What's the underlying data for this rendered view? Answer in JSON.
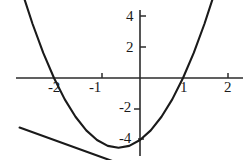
{
  "figure": {
    "title": "",
    "background_color": "#ffffff",
    "ink_color": "#1a1a1a",
    "width": 247,
    "height": 160
  },
  "axes": {
    "origin_px": {
      "x": 140,
      "y": 78
    },
    "px_per_unit_x": 43,
    "px_per_unit_y": 31,
    "x_axis_label": "",
    "y_axis_label": ""
  },
  "labels": {
    "y_top": "4",
    "y_upper": "2",
    "y_lower": "-2",
    "y_bottom": "-4",
    "x_left_2": "-2",
    "x_left_1": "-1",
    "x_right_1": "1",
    "x_right_2": "2"
  },
  "chart_data": {
    "type": "line",
    "title": "",
    "subtitle": "",
    "xlabel": "",
    "ylabel": "",
    "xlim": [
      -2.8,
      2.5
    ],
    "ylim": [
      -4.8,
      4.6
    ],
    "xticks": [
      -2,
      -1,
      1,
      2
    ],
    "xticklabels": [
      "-2",
      "-1",
      "1",
      "2"
    ],
    "yticks": [
      4,
      2,
      -2,
      -4
    ],
    "yticklabels": [
      "4",
      "2",
      "-2",
      "-4"
    ],
    "grid": false,
    "legend": "none",
    "annotations": [],
    "series": [
      {
        "name": "parabola",
        "equation": "y = x^2 + x - 2",
        "color": "#1a1a1a",
        "roots": [
          -2,
          1
        ],
        "vertex": [
          -0.5,
          -2.25
        ],
        "x": [
          -2.75,
          -2.5,
          -2.25,
          -2,
          -1.75,
          -1.5,
          -1.25,
          -1,
          -0.75,
          -0.5,
          -0.25,
          0,
          0.25,
          0.5,
          0.75,
          1,
          1.25,
          1.5,
          1.75,
          2,
          2.05
        ],
        "values": [
          2.81,
          1.75,
          0.81,
          0,
          -0.69,
          -1.25,
          -1.69,
          -2,
          -2.19,
          -2.25,
          -2.19,
          -2,
          -1.69,
          -1.25,
          -0.69,
          0,
          0.81,
          1.75,
          2.81,
          4,
          4.25
        ]
      },
      {
        "name": "line",
        "equation": "y = -0.5x - 3",
        "color": "#1a1a1a",
        "slope": -0.5,
        "intercept": -3,
        "x": [
          -2.8,
          2.1
        ],
        "values": [
          -1.6,
          -4.05
        ]
      }
    ]
  }
}
